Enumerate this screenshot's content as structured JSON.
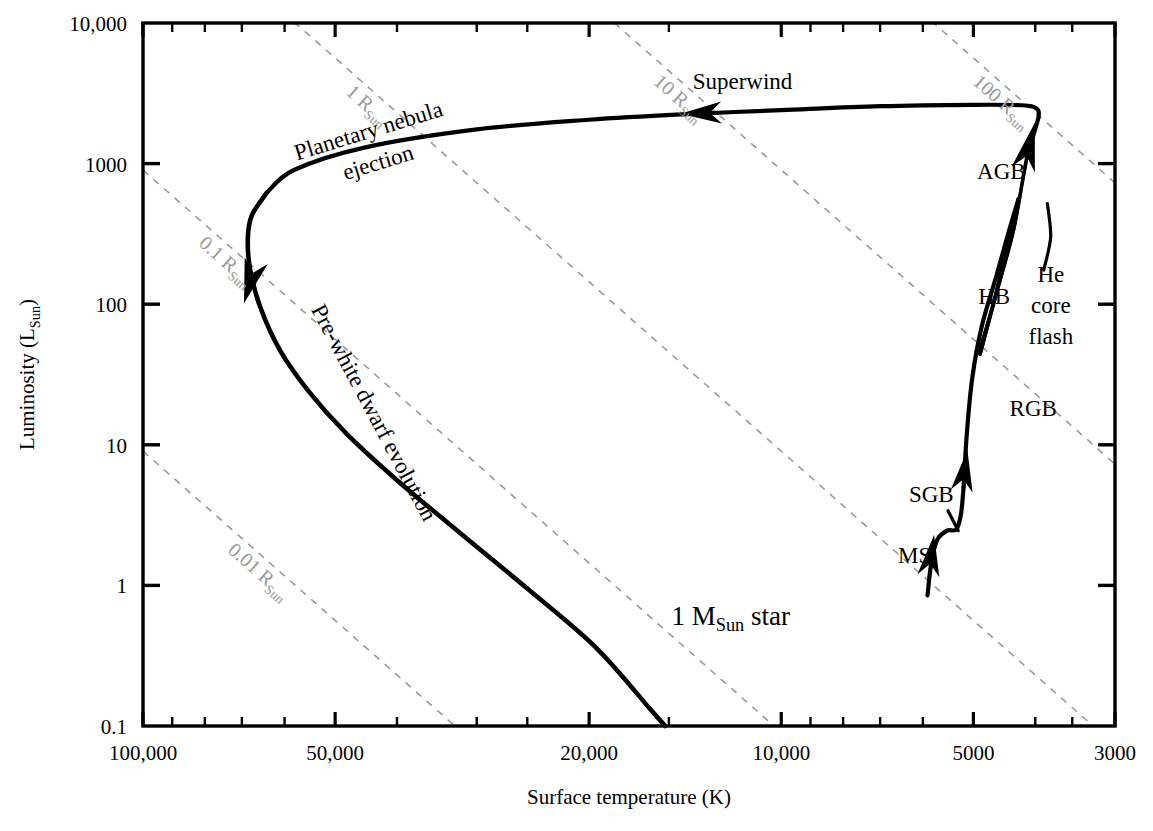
{
  "figure": {
    "kind": "hertzsprung-russell-evolution-diagram",
    "background": "#ffffff",
    "track_color": "#000000",
    "radius_line_color": "#9a9a9a"
  },
  "chart_data": {
    "type": "line",
    "title": "",
    "xlabel": "Surface temperature (K)",
    "ylabel": "Luminosity (L_Sun)",
    "ylabel_main": "Luminosity (L",
    "ylabel_sub": "Sun",
    "ylabel_tail": ")",
    "xlabel_text": "Surface temperature (K)",
    "x_scale": "log-reversed",
    "y_scale": "log",
    "xlim": [
      100000,
      3000
    ],
    "ylim": [
      0.1,
      10000
    ],
    "grid": false,
    "legend": "none",
    "xticks": [
      100000,
      50000,
      20000,
      10000,
      5000,
      3000
    ],
    "xtick_labels": [
      "100,000",
      "50,000",
      "20,000",
      "10,000",
      "5000",
      "3000"
    ],
    "yticks": [
      10000,
      1000,
      100,
      10,
      1,
      0.1
    ],
    "ytick_labels": [
      "10,000",
      "1000",
      "100",
      "10",
      "1",
      "0.1"
    ],
    "x_minor_ticks": [
      90000,
      80000,
      70000,
      60000,
      40000,
      30000,
      25000,
      15000,
      9000,
      8000,
      7000,
      6000,
      4000,
      3500
    ],
    "y_minor_ticks": [],
    "series": [
      {
        "name": "Main sequence to subgiant branch",
        "points": [
          [
            5900,
            0.85
          ],
          [
            5820,
            1.45
          ],
          [
            5700,
            2.1
          ],
          [
            5500,
            2.45
          ],
          [
            5320,
            2.5
          ],
          [
            5230,
            3.2
          ],
          [
            5180,
            5.0
          ]
        ]
      },
      {
        "name": "Red giant branch",
        "points": [
          [
            5180,
            5.0
          ],
          [
            5120,
            12
          ],
          [
            5020,
            30
          ],
          [
            4850,
            70
          ],
          [
            4600,
            160
          ],
          [
            4400,
            330
          ],
          [
            4250,
            560
          ]
        ]
      },
      {
        "name": "Helium core flash to horizontal branch",
        "points": [
          [
            4250,
            560
          ],
          [
            4620,
            115
          ],
          [
            4900,
            46
          ]
        ]
      },
      {
        "name": "Horizontal branch to asymptotic giant branch",
        "points": [
          [
            4880,
            44
          ],
          [
            4600,
            120
          ],
          [
            4330,
            330
          ],
          [
            4200,
            700
          ],
          [
            4120,
            1100
          ]
        ]
      },
      {
        "name": "Asymptotic giant branch to superwind",
        "points": [
          [
            4120,
            1100
          ],
          [
            4010,
            1700
          ],
          [
            3950,
            2200
          ],
          [
            3990,
            2480
          ],
          [
            4200,
            2600
          ],
          [
            5000,
            2620
          ],
          [
            7000,
            2560
          ],
          [
            10000,
            2400
          ],
          [
            14000,
            2250
          ],
          [
            20000,
            2050
          ],
          [
            30000,
            1750
          ],
          [
            45000,
            1300
          ],
          [
            58000,
            900
          ],
          [
            64000,
            620
          ]
        ]
      },
      {
        "name": "Planetary nebula ejection descent",
        "points": [
          [
            64000,
            620
          ],
          [
            67500,
            430
          ],
          [
            68500,
            300
          ],
          [
            68000,
            180
          ],
          [
            65500,
            95
          ],
          [
            61000,
            47
          ],
          [
            55000,
            24
          ],
          [
            48000,
            12
          ],
          [
            40000,
            5.6
          ],
          [
            32000,
            2.4
          ],
          [
            25000,
            0.95
          ],
          [
            19500,
            0.36
          ],
          [
            16000,
            0.13
          ],
          [
            15200,
            0.1
          ]
        ]
      }
    ],
    "arrows": [
      {
        "name": "ms-arrow",
        "x": 5830,
        "y": 1.55,
        "dir": "up"
      },
      {
        "name": "rgb-lower-arrow",
        "x": 5170,
        "y": 6.2,
        "dir": "up"
      },
      {
        "name": "agb-arrow",
        "x": 4105,
        "y": 1250,
        "dir": "up"
      },
      {
        "name": "superwind-arrow",
        "x": 13200,
        "y": 2290,
        "dir": "left"
      },
      {
        "name": "pre-white-dwarf-arrow",
        "x": 67700,
        "y": 152,
        "dir": "down"
      }
    ],
    "radius_lines": [
      {
        "label": "0.01 R_Sun",
        "text_main": "0.01 R",
        "text_sub": "Sun",
        "radius": 0.01
      },
      {
        "label": "0.1 R_Sun",
        "text_main": "0.1 R",
        "text_sub": "Sun",
        "radius": 0.1
      },
      {
        "label": "1 R_Sun",
        "text_main": "1 R",
        "text_sub": "Sun",
        "radius": 1
      },
      {
        "label": "10 R_Sun",
        "text_main": "10 R",
        "text_sub": "Sun",
        "radius": 10
      },
      {
        "label": "100 R_Sun",
        "text_main": "100 R",
        "text_sub": "Sun",
        "radius": 100
      }
    ],
    "annotations": [
      {
        "name": "planetary-nebula-ejection",
        "line1": "Planetary nebula",
        "line2": "ejection",
        "rotation": -17
      },
      {
        "name": "pre-white-dwarf-evolution",
        "text": "Pre-white dwarf evolution",
        "rotation": 62
      },
      {
        "name": "superwind",
        "text": "Superwind",
        "rotation": 0
      },
      {
        "name": "agb",
        "text": "AGB",
        "rotation": 0
      },
      {
        "name": "hb",
        "text": "HB",
        "rotation": 0
      },
      {
        "name": "he-core-flash",
        "line1": "He",
        "line2": "core",
        "line3": "flash",
        "rotation": 0
      },
      {
        "name": "rgb",
        "text": "RGB",
        "rotation": 0
      },
      {
        "name": "sgb",
        "text": "SGB",
        "rotation": 0
      },
      {
        "name": "ms",
        "text": "MS",
        "rotation": 0
      },
      {
        "name": "star-mass",
        "text_main": "1 M",
        "text_sub": "Sun",
        "text_tail": " star",
        "rotation": 0
      }
    ]
  }
}
